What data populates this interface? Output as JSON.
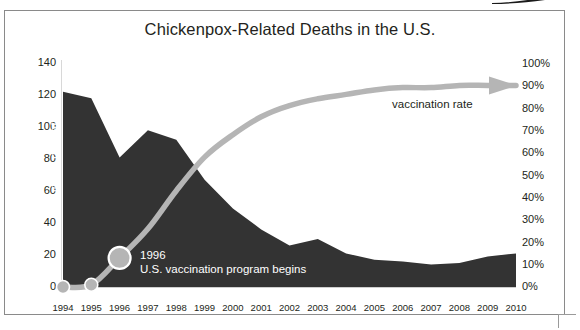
{
  "chart_data": {
    "type": "area",
    "title": "Chickenpox-Related Deaths in the U.S.",
    "xlabel": "",
    "ylabel": "number of deaths",
    "ylabel_right": "vaccination rate",
    "categories": [
      "1994",
      "1995",
      "1996",
      "1997",
      "1998",
      "1999",
      "2000",
      "2001",
      "2002",
      "2003",
      "2004",
      "2005",
      "2006",
      "2007",
      "2008",
      "2009",
      "2010"
    ],
    "series": [
      {
        "name": "number of deaths",
        "type": "area",
        "axis": "left",
        "color": "#333333",
        "values": [
          122,
          118,
          81,
          98,
          92,
          67,
          49,
          36,
          26,
          30,
          21,
          17,
          16,
          14,
          15,
          19,
          21
        ]
      },
      {
        "name": "vaccination rate",
        "type": "line",
        "axis": "right",
        "color": "#b5b5b5",
        "values": [
          0,
          1,
          13,
          26,
          43,
          58,
          68,
          76,
          81,
          84,
          86,
          88,
          89,
          89,
          90,
          90,
          90
        ]
      }
    ],
    "ylim": [
      0,
      140
    ],
    "yticks": [
      "0",
      "20",
      "40",
      "60",
      "80",
      "100",
      "120",
      "140"
    ],
    "ylim_right": [
      0,
      100
    ],
    "yticks_right": [
      "0%",
      "10%",
      "20%",
      "30%",
      "40%",
      "50%",
      "60%",
      "70%",
      "80%",
      "90%",
      "100%"
    ],
    "grid": false,
    "legend_position": "inline-annotations",
    "annotations": [
      {
        "name": "vaccination-program-marker",
        "line1": "1996",
        "line2": "U.S. vaccination program begins",
        "at_category": "1996"
      },
      {
        "name": "vaccination-rate-label",
        "text": "vaccination rate"
      }
    ],
    "markers": [
      {
        "category": "1994",
        "value": 0,
        "size": "small"
      },
      {
        "category": "1995",
        "value": 1,
        "size": "small"
      },
      {
        "category": "1996",
        "value": 13,
        "size": "large"
      }
    ],
    "arrow_end": {
      "category": "2010",
      "value": 90,
      "direction": "right"
    }
  },
  "colors": {
    "area": "#333333",
    "line": "#b5b5b5",
    "text": "#231f20",
    "annotation_text": "#ffffff",
    "axis": "#d8d8d8",
    "frame": "#8a8a8a",
    "background": "#ffffff"
  }
}
